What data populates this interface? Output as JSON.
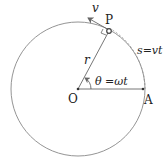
{
  "diagram": {
    "labels": {
      "center": "O",
      "point_p": "P",
      "point_a": "A",
      "radius": "r",
      "velocity": "v",
      "angle": "θ =ωt",
      "arc": "s=vt"
    },
    "colors": {
      "stroke": "#888888",
      "text": "#222222",
      "arc_dash": "#999999"
    }
  }
}
